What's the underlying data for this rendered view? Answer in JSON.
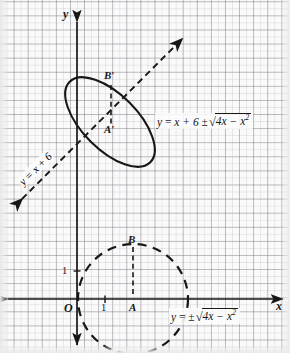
{
  "figure": {
    "background_color": "#fafafa",
    "grid_color": "#787882",
    "ink_color": "#171717"
  },
  "axes": {
    "x_label": "x",
    "y_label": "y",
    "origin_label": "O",
    "x_tick_label": "1",
    "y_tick_label": "1",
    "x_axis_y_px": 299,
    "y_axis_x_px": 77,
    "unit_px": 28
  },
  "upper_graph": {
    "name": "sheared-ellipse-graph",
    "curve_label": "tilted-ellipse",
    "point_labels": [
      {
        "id": "A-prime",
        "text": "A′"
      },
      {
        "id": "B-prime",
        "text": "B′"
      }
    ],
    "equation": {
      "lhs": "y",
      "eq": "=",
      "term": "x + 6",
      "pm": "±",
      "radicand": "4x − x",
      "exponent": "2",
      "full_text": "y = x + 6 ± √(4x − x²)",
      "clipped_at_right_edge": true
    },
    "line_label": {
      "text": "y = x + 6",
      "style": "dashed-arrow-both-ends",
      "rotation_deg": -45
    }
  },
  "lower_graph": {
    "name": "circle-graph",
    "curve_label": "dashed-circle",
    "circle": {
      "center_x": 2,
      "center_y": 0,
      "radius": 2
    },
    "point_labels": [
      {
        "id": "A",
        "text": "A"
      },
      {
        "id": "B",
        "text": "B"
      }
    ],
    "equation": {
      "lhs": "y",
      "eq": "=",
      "pm": "±",
      "radicand": "4x − x",
      "exponent": "2",
      "full_text": "y = ± √(4x − x²)"
    }
  }
}
